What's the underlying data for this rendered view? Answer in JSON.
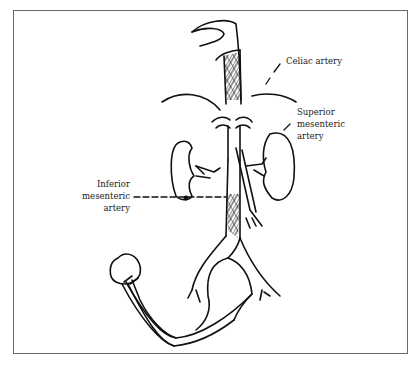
{
  "figure": {
    "type": "anatomical line drawing",
    "border_color": "#6a6a6a",
    "line_color": "#111111",
    "background": "#ffffff"
  },
  "labels": {
    "celiac": {
      "line1": "Celiac artery"
    },
    "superior_mesenteric": {
      "line1": "Superior",
      "line2": "mesenteric",
      "line3": "artery"
    },
    "inferior_mesenteric": {
      "line1": "Inferior",
      "line2": "mesenteric",
      "line3": "artery"
    }
  }
}
